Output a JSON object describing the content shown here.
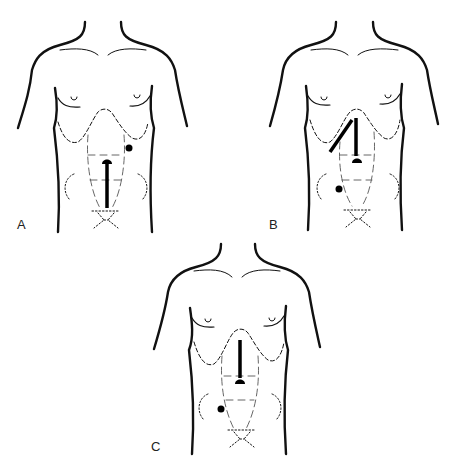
{
  "figure": {
    "panels": [
      {
        "id": "A",
        "label": "A",
        "incision": "lower midline (umbilicus to pubis)",
        "port": "left upper quadrant dot"
      },
      {
        "id": "B",
        "label": "B",
        "incision": "upper midline plus right subcostal",
        "port": "right lower quadrant dot"
      },
      {
        "id": "C",
        "label": "C",
        "incision": "upper midline (xiphoid to umbilicus)",
        "port": "right lower quadrant dot"
      }
    ]
  },
  "colors": {
    "line": "#111111",
    "background": "#ffffff"
  }
}
